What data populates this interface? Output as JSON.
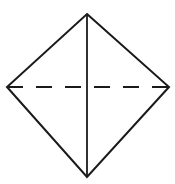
{
  "figure": {
    "name": "rhombus-with-diagonals",
    "canvas": {
      "width": 175,
      "height": 184,
      "background": "#ffffff"
    },
    "colors": {
      "stroke": "#1a1a1a",
      "fill": "#ffffff",
      "dashed_stroke": "#1a1a1a"
    },
    "vertices": {
      "top": {
        "label": "top",
        "x": 87,
        "y": 14
      },
      "right": {
        "label": "right",
        "x": 169,
        "y": 87
      },
      "bottom": {
        "label": "bottom",
        "x": 87,
        "y": 177
      },
      "left": {
        "label": "left",
        "x": 7,
        "y": 87
      }
    },
    "outline": {
      "name": "rhombus-outline",
      "points": "87,14 169,87 87,177 7,87",
      "stroke_width": 2.0,
      "style": "solid"
    },
    "vertical_diagonal": {
      "name": "vertical-diagonal",
      "x1": 87,
      "y1": 14,
      "x2": 87,
      "y2": 177,
      "stroke_width": 1.8,
      "style": "solid"
    },
    "horizontal_diagonal": {
      "name": "horizontal-diagonal",
      "x1": 7,
      "y1": 87,
      "x2": 169,
      "y2": 87,
      "stroke_width": 2.0,
      "style": "dashed",
      "dash_pattern": "16 13",
      "dash_count_per_side": 2
    }
  }
}
